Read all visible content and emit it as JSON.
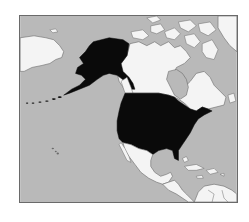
{
  "map": {
    "title": "Locator map of the United States in North America",
    "highlighted_region": "United States (including Alaska)",
    "colors": {
      "ocean": "#b9b9b9",
      "land": "#f4f4f4",
      "highlight": "#0a0a0a",
      "border": "#6a6a6a",
      "frame": "#6a6a6a",
      "page": "#ffffff"
    },
    "regions": [
      {
        "name": "Alaska",
        "highlighted": true
      },
      {
        "name": "Contiguous United States",
        "highlighted": true
      },
      {
        "name": "Canada",
        "highlighted": false
      },
      {
        "name": "Greenland",
        "highlighted": false
      },
      {
        "name": "Russia (Chukotka)",
        "highlighted": false
      },
      {
        "name": "Mexico",
        "highlighted": false
      },
      {
        "name": "Central America",
        "highlighted": false
      },
      {
        "name": "Caribbean",
        "highlighted": false
      },
      {
        "name": "Northern South America",
        "highlighted": false
      }
    ]
  }
}
